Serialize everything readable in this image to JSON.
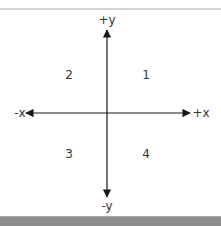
{
  "diagram": {
    "axis_labels": {
      "positive_y": "+y",
      "negative_y": "-y",
      "positive_x": "+x",
      "negative_x": "-x"
    },
    "quadrants": [
      {
        "id": "q1",
        "label": "1"
      },
      {
        "id": "q2",
        "label": "2"
      },
      {
        "id": "q3",
        "label": "3"
      },
      {
        "id": "q4",
        "label": "4"
      }
    ],
    "colors": {
      "axis": "#1a1a1a",
      "text": "#333333",
      "bottom_bar": "#8c8c8c",
      "top_line": "#d4d4d4"
    }
  }
}
